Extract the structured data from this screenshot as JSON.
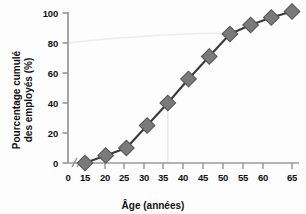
{
  "chart_data": {
    "type": "line",
    "title": "",
    "xlabel": "Âge (années)",
    "ylabel": "Pourcentage cumulé des employés (%)",
    "ylabel_line1": "Pourcentage cumulé",
    "ylabel_line2": "des employés (%)",
    "x": [
      15,
      20,
      25,
      30,
      35,
      40,
      45,
      50,
      55,
      60,
      65
    ],
    "values": [
      0,
      5,
      10,
      25,
      40,
      56,
      71,
      86,
      92,
      97,
      101
    ],
    "series": [
      {
        "name": "Pourcentage cumulé des employés",
        "values": [
          0,
          5,
          10,
          25,
          40,
          56,
          71,
          86,
          92,
          97,
          101
        ]
      }
    ],
    "xticks": [
      0,
      15,
      20,
      25,
      30,
      35,
      40,
      45,
      50,
      55,
      60,
      65
    ],
    "xtick_labels": [
      "0",
      "15",
      "20",
      "25",
      "30",
      "35",
      "40",
      "45",
      "50",
      "55",
      "60",
      "65"
    ],
    "yticks": [
      0,
      20,
      40,
      60,
      80,
      100
    ],
    "ytick_labels": [
      "0",
      "20",
      "40",
      "60",
      "80",
      "100"
    ],
    "xlim": [
      0,
      65
    ],
    "ylim": [
      0,
      100
    ],
    "grid": false,
    "legend": "none",
    "axis_break": {
      "axis": "x",
      "between": [
        0,
        15
      ],
      "symbol": "//"
    },
    "annotations": [
      {
        "name": "guide-line-35-to-40",
        "type": "vertical-guide",
        "x": 35,
        "y_from": 0,
        "y_to": 40
      },
      {
        "name": "guide-line-80-percent",
        "type": "horizontal-guide",
        "y": 80,
        "x_from": 15,
        "x_to": 50
      }
    ],
    "marker": "diamond",
    "marker_color": "#7a7a7a",
    "marker_edge_color": "#555555",
    "line_color": "#3a3a3a",
    "axis_color": "#8a8a8a",
    "guide_color": "#e8e8e8",
    "background_color": "#fdfdfd"
  },
  "axes": {
    "x_title": "Âge (années)",
    "y_title_line1": "Pourcentage cumulé",
    "y_title_line2": "des employés (%)"
  }
}
